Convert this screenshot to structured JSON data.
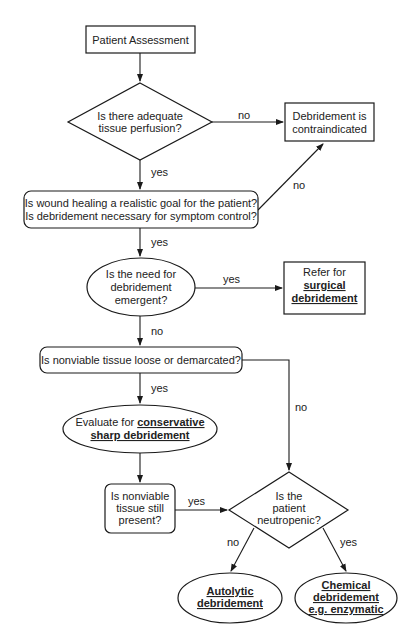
{
  "diagram": {
    "nodes": {
      "patient_assessment": {
        "shape": "rect",
        "lines": [
          {
            "text": "Patient Assessment"
          }
        ]
      },
      "perfusion": {
        "shape": "diamond",
        "lines": [
          {
            "text": "Is there adequate"
          },
          {
            "text": "tissue perfusion?"
          }
        ]
      },
      "contraindicated": {
        "shape": "rect",
        "lines": [
          {
            "text": "Debridement is"
          },
          {
            "text": "contraindicated"
          }
        ]
      },
      "realistic_goal": {
        "shape": "rounded-rect",
        "lines": [
          {
            "text": "Is wound healing a realistic goal for the patient?"
          },
          {
            "text": "Is debridement necessary for symptom control?"
          }
        ]
      },
      "emergent": {
        "shape": "ellipse",
        "lines": [
          {
            "text": "Is the need for"
          },
          {
            "text": "debridement"
          },
          {
            "text": "emergent?"
          }
        ]
      },
      "surgical": {
        "shape": "rect",
        "lines": [
          {
            "text": "Refer for"
          },
          {
            "text": "surgical",
            "bold": true
          },
          {
            "text": "debridement",
            "bold": true
          }
        ]
      },
      "loose": {
        "shape": "rounded-rect",
        "lines": [
          {
            "text": "Is nonviable tissue loose or demarcated?"
          }
        ]
      },
      "conservative": {
        "shape": "ellipse",
        "lines": [
          {
            "text_plain": "Evaluate for ",
            "text_bold": "conservative"
          },
          {
            "text": "sharp debridement",
            "bold": true
          }
        ]
      },
      "still_present": {
        "shape": "rounded-rect",
        "lines": [
          {
            "text": "Is nonviable"
          },
          {
            "text": "tissue still"
          },
          {
            "text": "present?"
          }
        ]
      },
      "neutropenic": {
        "shape": "diamond",
        "lines": [
          {
            "text": "Is the"
          },
          {
            "text": "patient"
          },
          {
            "text": "neutropenic?"
          }
        ]
      },
      "autolytic": {
        "shape": "ellipse",
        "lines": [
          {
            "text": "Autolytic",
            "bold": true
          },
          {
            "text": "debridement",
            "bold": true
          }
        ]
      },
      "chemical": {
        "shape": "ellipse",
        "lines": [
          {
            "text": "Chemical",
            "bold": true
          },
          {
            "text": "debridement",
            "bold": true
          },
          {
            "text": "e.g. enzymatic",
            "bold": true
          }
        ]
      }
    },
    "edges": [
      {
        "from": "patient_assessment",
        "to": "perfusion",
        "label": ""
      },
      {
        "from": "perfusion",
        "to": "contraindicated",
        "label": "no"
      },
      {
        "from": "perfusion",
        "to": "realistic_goal",
        "label": "yes"
      },
      {
        "from": "realistic_goal",
        "to": "contraindicated",
        "label": "no"
      },
      {
        "from": "realistic_goal",
        "to": "emergent",
        "label": "yes"
      },
      {
        "from": "emergent",
        "to": "surgical",
        "label": "yes"
      },
      {
        "from": "emergent",
        "to": "loose",
        "label": "no"
      },
      {
        "from": "loose",
        "to": "conservative",
        "label": "yes"
      },
      {
        "from": "loose",
        "to": "neutropenic",
        "label": "no"
      },
      {
        "from": "conservative",
        "to": "still_present",
        "label": ""
      },
      {
        "from": "still_present",
        "to": "neutropenic",
        "label": "yes"
      },
      {
        "from": "neutropenic",
        "to": "autolytic",
        "label": "no"
      },
      {
        "from": "neutropenic",
        "to": "chemical",
        "label": "yes"
      }
    ]
  }
}
